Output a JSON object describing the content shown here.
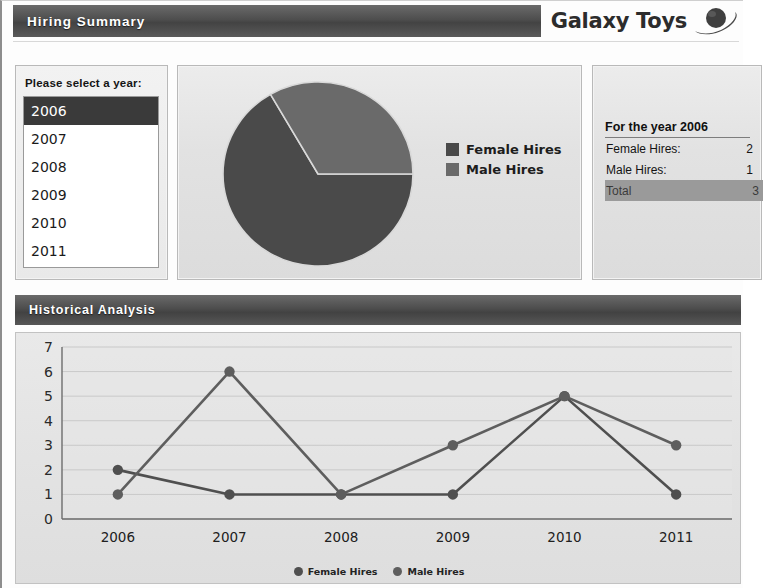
{
  "header": {
    "title": "Hiring Summary",
    "brand": "Galaxy Toys",
    "brand_icon": "saturn-planet-icon"
  },
  "year_panel": {
    "label": "Please select a year:",
    "years": [
      "2006",
      "2007",
      "2008",
      "2009",
      "2010",
      "2011"
    ],
    "selected": "2006"
  },
  "pie_panel": {
    "legend": [
      {
        "label": "Female Hires",
        "color": "#4a4a4a"
      },
      {
        "label": "Male Hires",
        "color": "#656565"
      }
    ]
  },
  "detail_panel": {
    "title": "For the year 2006",
    "rows": [
      {
        "label": "Female Hires:",
        "value": "2"
      },
      {
        "label": "Male Hires:",
        "value": "1"
      },
      {
        "label": "Total",
        "value": "3"
      }
    ]
  },
  "historical": {
    "title": "Historical Analysis",
    "legend": [
      {
        "label": "Female Hires",
        "color": "#4f4f4f"
      },
      {
        "label": "Male Hires",
        "color": "#5e5e5e"
      }
    ]
  },
  "chart_data": [
    {
      "type": "pie",
      "title": "",
      "labels": [
        "Female Hires",
        "Male Hires"
      ],
      "values": [
        2,
        1
      ],
      "colors": [
        "#4a4a4a",
        "#6a6a6a"
      ],
      "start_angle_deg": 0,
      "legend_position": "right"
    },
    {
      "type": "line",
      "title": "Historical Analysis",
      "x": [
        "2006",
        "2007",
        "2008",
        "2009",
        "2010",
        "2011"
      ],
      "series": [
        {
          "name": "Female Hires",
          "values": [
            2,
            1,
            1,
            1,
            5,
            1
          ],
          "color": "#4f4f4f"
        },
        {
          "name": "Male Hires",
          "values": [
            1,
            6,
            1,
            3,
            5,
            3
          ],
          "color": "#5e5e5e"
        }
      ],
      "ylabel": "",
      "xlabel": "",
      "ylim": [
        0,
        7
      ],
      "yticks": [
        0,
        1,
        2,
        3,
        4,
        5,
        6,
        7
      ],
      "grid": true,
      "legend_position": "bottom"
    }
  ]
}
